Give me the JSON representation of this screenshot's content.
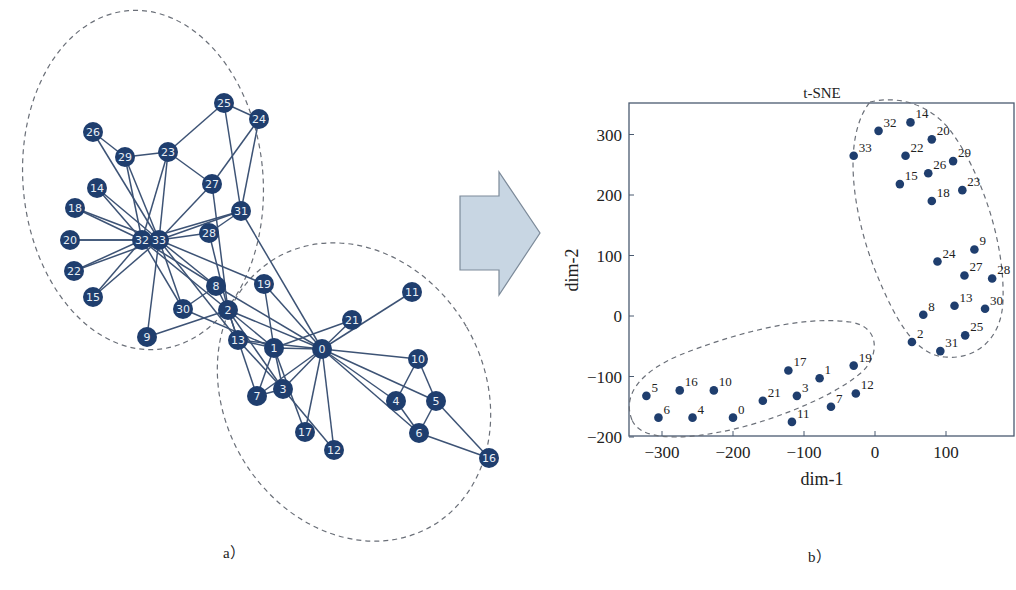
{
  "panels": {
    "a": {
      "label": "a）",
      "description": "Karate club graph with two communities",
      "nodes": [
        {
          "id": "0",
          "x": 322,
          "y": 349
        },
        {
          "id": "1",
          "x": 274,
          "y": 348
        },
        {
          "id": "2",
          "x": 228,
          "y": 310
        },
        {
          "id": "3",
          "x": 283,
          "y": 389
        },
        {
          "id": "4",
          "x": 396,
          "y": 401
        },
        {
          "id": "5",
          "x": 436,
          "y": 401
        },
        {
          "id": "6",
          "x": 419,
          "y": 433
        },
        {
          "id": "7",
          "x": 257,
          "y": 396
        },
        {
          "id": "8",
          "x": 216,
          "y": 286
        },
        {
          "id": "9",
          "x": 147,
          "y": 337
        },
        {
          "id": "10",
          "x": 418,
          "y": 359
        },
        {
          "id": "11",
          "x": 412,
          "y": 292
        },
        {
          "id": "12",
          "x": 334,
          "y": 450
        },
        {
          "id": "13",
          "x": 238,
          "y": 340
        },
        {
          "id": "14",
          "x": 97,
          "y": 188
        },
        {
          "id": "15",
          "x": 93,
          "y": 297
        },
        {
          "id": "16",
          "x": 489,
          "y": 458
        },
        {
          "id": "17",
          "x": 305,
          "y": 432
        },
        {
          "id": "18",
          "x": 75,
          "y": 208
        },
        {
          "id": "19",
          "x": 264,
          "y": 284
        },
        {
          "id": "20",
          "x": 70,
          "y": 240
        },
        {
          "id": "21",
          "x": 352,
          "y": 320
        },
        {
          "id": "22",
          "x": 74,
          "y": 271
        },
        {
          "id": "23",
          "x": 168,
          "y": 152
        },
        {
          "id": "24",
          "x": 259,
          "y": 119
        },
        {
          "id": "25",
          "x": 224,
          "y": 103
        },
        {
          "id": "26",
          "x": 93,
          "y": 132
        },
        {
          "id": "27",
          "x": 212,
          "y": 184
        },
        {
          "id": "28",
          "x": 209,
          "y": 233
        },
        {
          "id": "29",
          "x": 125,
          "y": 157
        },
        {
          "id": "30",
          "x": 183,
          "y": 309
        },
        {
          "id": "31",
          "x": 241,
          "y": 211
        },
        {
          "id": "32",
          "x": 142,
          "y": 240
        },
        {
          "id": "33",
          "x": 159,
          "y": 240
        }
      ],
      "edges": [
        [
          "0",
          "1"
        ],
        [
          "0",
          "2"
        ],
        [
          "0",
          "3"
        ],
        [
          "0",
          "4"
        ],
        [
          "0",
          "5"
        ],
        [
          "0",
          "6"
        ],
        [
          "0",
          "7"
        ],
        [
          "0",
          "8"
        ],
        [
          "0",
          "10"
        ],
        [
          "0",
          "11"
        ],
        [
          "0",
          "12"
        ],
        [
          "0",
          "13"
        ],
        [
          "0",
          "17"
        ],
        [
          "0",
          "19"
        ],
        [
          "0",
          "21"
        ],
        [
          "0",
          "31"
        ],
        [
          "1",
          "2"
        ],
        [
          "1",
          "3"
        ],
        [
          "1",
          "7"
        ],
        [
          "1",
          "13"
        ],
        [
          "1",
          "17"
        ],
        [
          "1",
          "19"
        ],
        [
          "1",
          "21"
        ],
        [
          "1",
          "30"
        ],
        [
          "2",
          "3"
        ],
        [
          "2",
          "7"
        ],
        [
          "2",
          "8"
        ],
        [
          "2",
          "9"
        ],
        [
          "2",
          "13"
        ],
        [
          "2",
          "27"
        ],
        [
          "2",
          "28"
        ],
        [
          "2",
          "32"
        ],
        [
          "3",
          "7"
        ],
        [
          "3",
          "12"
        ],
        [
          "3",
          "13"
        ],
        [
          "4",
          "6"
        ],
        [
          "4",
          "10"
        ],
        [
          "5",
          "6"
        ],
        [
          "5",
          "10"
        ],
        [
          "5",
          "16"
        ],
        [
          "6",
          "16"
        ],
        [
          "8",
          "30"
        ],
        [
          "8",
          "32"
        ],
        [
          "8",
          "33"
        ],
        [
          "9",
          "33"
        ],
        [
          "13",
          "33"
        ],
        [
          "14",
          "32"
        ],
        [
          "14",
          "33"
        ],
        [
          "15",
          "32"
        ],
        [
          "15",
          "33"
        ],
        [
          "18",
          "32"
        ],
        [
          "18",
          "33"
        ],
        [
          "19",
          "33"
        ],
        [
          "20",
          "32"
        ],
        [
          "20",
          "33"
        ],
        [
          "22",
          "32"
        ],
        [
          "22",
          "33"
        ],
        [
          "23",
          "25"
        ],
        [
          "23",
          "27"
        ],
        [
          "23",
          "29"
        ],
        [
          "23",
          "32"
        ],
        [
          "23",
          "33"
        ],
        [
          "24",
          "25"
        ],
        [
          "24",
          "27"
        ],
        [
          "24",
          "31"
        ],
        [
          "25",
          "31"
        ],
        [
          "26",
          "29"
        ],
        [
          "26",
          "33"
        ],
        [
          "27",
          "33"
        ],
        [
          "28",
          "31"
        ],
        [
          "28",
          "33"
        ],
        [
          "29",
          "32"
        ],
        [
          "29",
          "33"
        ],
        [
          "30",
          "32"
        ],
        [
          "30",
          "33"
        ],
        [
          "31",
          "32"
        ],
        [
          "31",
          "33"
        ],
        [
          "32",
          "33"
        ]
      ],
      "clusters": [
        {
          "cx": 143,
          "cy": 180,
          "rx": 120,
          "ry": 170,
          "rotate": -5
        },
        {
          "cx": 354,
          "cy": 392,
          "rx": 130,
          "ry": 155,
          "rotate": -30
        }
      ]
    },
    "arrow": {
      "shape": "block-arrow-right",
      "fill": "#c8d6e3"
    },
    "b": {
      "label": "b）"
    }
  },
  "chart_data": {
    "type": "scatter",
    "title": "t-SNE",
    "xlabel": "dim-1",
    "ylabel": "dim-2",
    "xlim": [
      -345,
      195
    ],
    "ylim": [
      -200,
      350
    ],
    "xticks": [
      -300,
      -200,
      -100,
      0,
      100
    ],
    "yticks": [
      -200,
      -100,
      0,
      100,
      200,
      300
    ],
    "xtick_labels": [
      "−300",
      "−200",
      "−100",
      "0",
      "100"
    ],
    "ytick_labels": [
      "−200",
      "−100",
      "0",
      "100",
      "200",
      "300"
    ],
    "grid": false,
    "legend": null,
    "points": [
      {
        "label": "32",
        "x": 5,
        "y": 306
      },
      {
        "label": "14",
        "x": 50,
        "y": 320
      },
      {
        "label": "20",
        "x": 80,
        "y": 292
      },
      {
        "label": "33",
        "x": -30,
        "y": 265
      },
      {
        "label": "22",
        "x": 43,
        "y": 265
      },
      {
        "label": "29",
        "x": 110,
        "y": 256
      },
      {
        "label": "26",
        "x": 75,
        "y": 236
      },
      {
        "label": "15",
        "x": 35,
        "y": 218
      },
      {
        "label": "23",
        "x": 123,
        "y": 208
      },
      {
        "label": "18",
        "x": 80,
        "y": 190
      },
      {
        "label": "9",
        "x": 140,
        "y": 110
      },
      {
        "label": "24",
        "x": 88,
        "y": 90
      },
      {
        "label": "27",
        "x": 126,
        "y": 67
      },
      {
        "label": "28",
        "x": 165,
        "y": 62
      },
      {
        "label": "8",
        "x": 68,
        "y": 2
      },
      {
        "label": "13",
        "x": 112,
        "y": 17
      },
      {
        "label": "30",
        "x": 155,
        "y": 12
      },
      {
        "label": "2",
        "x": 52,
        "y": -43
      },
      {
        "label": "31",
        "x": 92,
        "y": -58
      },
      {
        "label": "25",
        "x": 127,
        "y": -32
      },
      {
        "label": "5",
        "x": -322,
        "y": -132
      },
      {
        "label": "16",
        "x": -275,
        "y": -123
      },
      {
        "label": "10",
        "x": -227,
        "y": -123
      },
      {
        "label": "6",
        "x": -305,
        "y": -168
      },
      {
        "label": "4",
        "x": -257,
        "y": -168
      },
      {
        "label": "0",
        "x": -200,
        "y": -168
      },
      {
        "label": "21",
        "x": -158,
        "y": -140
      },
      {
        "label": "17",
        "x": -122,
        "y": -90
      },
      {
        "label": "1",
        "x": -78,
        "y": -103
      },
      {
        "label": "3",
        "x": -110,
        "y": -132
      },
      {
        "label": "11",
        "x": -117,
        "y": -175
      },
      {
        "label": "7",
        "x": -62,
        "y": -150
      },
      {
        "label": "19",
        "x": -30,
        "y": -82
      },
      {
        "label": "12",
        "x": -27,
        "y": -128
      }
    ],
    "clusters": [
      {
        "name": "cluster-upper-right",
        "members": [
          "32",
          "14",
          "20",
          "33",
          "22",
          "29",
          "26",
          "15",
          "23",
          "18",
          "9",
          "24",
          "27",
          "28",
          "8",
          "13",
          "30",
          "2",
          "31",
          "25"
        ]
      },
      {
        "name": "cluster-lower-left",
        "members": [
          "5",
          "16",
          "10",
          "6",
          "4",
          "0",
          "21",
          "17",
          "1",
          "3",
          "11",
          "7",
          "19",
          "12"
        ]
      }
    ]
  }
}
